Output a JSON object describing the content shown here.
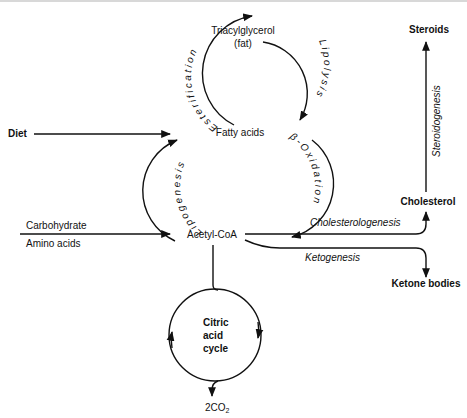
{
  "diagram": {
    "nodes": {
      "triacylglycerol": "Triacylglycerol",
      "triacylglycerol_sub": "(fat)",
      "fatty_acids": "Fatty acids",
      "acetyl_coa": "Acetyl-CoA",
      "diet": "Diet",
      "carbohydrate": "Carbohydrate",
      "amino_acids": "Amino acids",
      "steroids": "Steroids",
      "cholesterol": "Cholesterol",
      "ketone_bodies": "Ketone bodies",
      "citric_1": "Citric",
      "citric_2": "acid",
      "citric_3": "cycle",
      "co2": "2CO",
      "co2_sub": "2"
    },
    "processes": {
      "esterification": "Esterification",
      "lipolysis": "Lipolysis",
      "lipogenesis": "Lipogenesis",
      "beta_oxidation": "β-Oxidation",
      "cholesterologenesis": "Cholesterologenesis",
      "ketogenesis": "Ketogenesis",
      "steroidogenesis": "Steroidogenesis"
    }
  }
}
